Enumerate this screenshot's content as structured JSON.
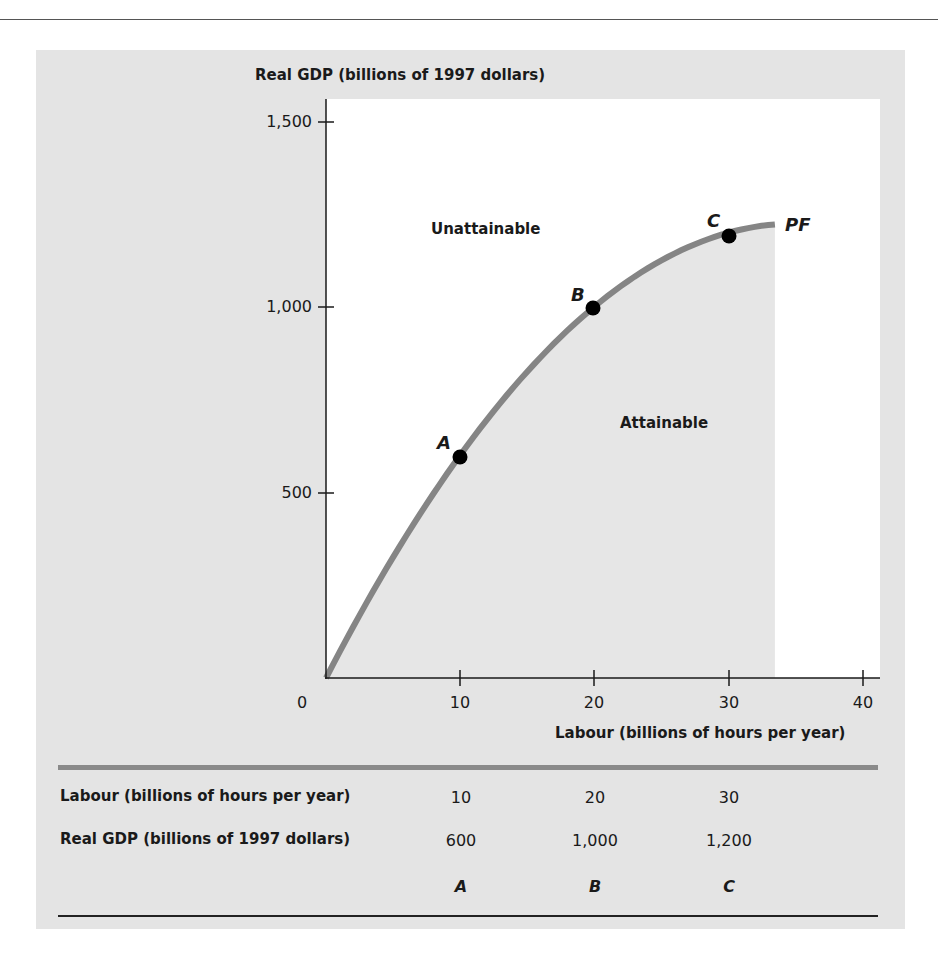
{
  "chart_data": {
    "type": "line",
    "title": "",
    "xlabel": "Labour (billions of hours per year)",
    "ylabel": "Real GDP (billions of 1997 dollars)",
    "xlim": [
      0,
      40
    ],
    "ylim": [
      0,
      1500
    ],
    "x_ticks": [
      "0",
      "10",
      "20",
      "30",
      "40"
    ],
    "y_ticks": [
      "500",
      "1,000",
      "1,500"
    ],
    "grid": false,
    "series": [
      {
        "name": "PF",
        "x": [
          0,
          10,
          20,
          30,
          33.5
        ],
        "values": [
          0,
          600,
          1000,
          1200,
          1223
        ]
      }
    ],
    "points": [
      {
        "label": "A",
        "x": 10,
        "y": 600
      },
      {
        "label": "B",
        "x": 20,
        "y": 1000
      },
      {
        "label": "C",
        "x": 30,
        "y": 1200
      }
    ],
    "annotations": [
      "Unattainable",
      "Attainable",
      "PF"
    ],
    "table": {
      "rows": [
        {
          "label": "Labour (billions of hours per year)",
          "values": [
            "10",
            "20",
            "30"
          ]
        },
        {
          "label": "Real GDP (billions of 1997 dollars)",
          "values": [
            "600",
            "1,000",
            "1,200"
          ]
        }
      ],
      "points": [
        "A",
        "B",
        "C"
      ]
    }
  },
  "axes": {
    "ylabel": "Real GDP (billions of 1997 dollars)",
    "xlabel": "Labour (billions of hours per year)",
    "y_ticks": {
      "t1500": "1,500",
      "t1000": "1,000",
      "t500": "500"
    },
    "x_ticks": {
      "t0": "0",
      "t10": "10",
      "t20": "20",
      "t30": "30",
      "t40": "40"
    }
  },
  "labels": {
    "unattainable": "Unattainable",
    "attainable": "Attainable",
    "pf": "PF",
    "a": "A",
    "b": "B",
    "c": "C"
  },
  "table": {
    "row1": {
      "label": "Labour (billions of hours per year)",
      "v1": "10",
      "v2": "20",
      "v3": "30"
    },
    "row2": {
      "label": "Real GDP (billions of 1997 dollars)",
      "v1": "600",
      "v2": "1,000",
      "v3": "1,200"
    },
    "row3": {
      "v1": "A",
      "v2": "B",
      "v3": "C"
    }
  },
  "colors": {
    "panel": "#e4e4e4",
    "plot_bg": "#ffffff",
    "attainable_fill": "#e8e8e8",
    "curve": "#858585",
    "point": "#000000"
  }
}
